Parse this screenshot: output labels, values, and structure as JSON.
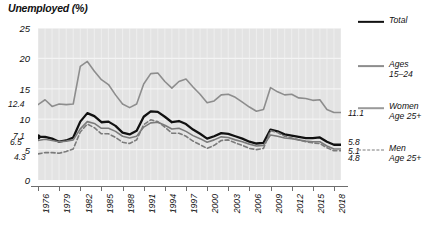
{
  "chart_data": {
    "type": "line",
    "title": "Unemployed (%)",
    "xlabel": "",
    "ylabel": "Unemployed (%)",
    "ylim": [
      0,
      25
    ],
    "yticks": [
      0,
      5,
      10,
      15,
      20,
      25
    ],
    "xlim": [
      1976,
      2019
    ],
    "xticks": [
      1976,
      1979,
      1982,
      1985,
      1988,
      1991,
      1994,
      1997,
      2000,
      2003,
      2006,
      2009,
      2012,
      2015,
      2018
    ],
    "grid": true,
    "legend_position": "right",
    "plot_background": "#e3e3e3",
    "x": [
      1976,
      1977,
      1978,
      1979,
      1980,
      1981,
      1982,
      1983,
      1984,
      1985,
      1986,
      1987,
      1988,
      1989,
      1990,
      1991,
      1992,
      1993,
      1994,
      1995,
      1996,
      1997,
      1998,
      1999,
      2000,
      2001,
      2002,
      2003,
      2004,
      2005,
      2006,
      2007,
      2008,
      2009,
      2010,
      2011,
      2012,
      2013,
      2014,
      2015,
      2016,
      2017,
      2018,
      2019
    ],
    "series": [
      {
        "name": "Total",
        "color": "#111111",
        "style": "solid",
        "width": 2.3,
        "start_label": "7.1",
        "end_label": "5.8",
        "values": [
          7.1,
          7.1,
          6.8,
          6.3,
          6.5,
          7.0,
          9.6,
          11.0,
          10.5,
          9.5,
          9.6,
          8.9,
          7.8,
          7.5,
          8.1,
          10.4,
          11.3,
          11.2,
          10.4,
          9.5,
          9.7,
          9.2,
          8.3,
          7.6,
          6.8,
          7.2,
          7.7,
          7.6,
          7.2,
          6.8,
          6.3,
          6.0,
          6.1,
          8.3,
          8.0,
          7.5,
          7.3,
          7.1,
          6.9,
          6.9,
          7.0,
          6.3,
          5.8,
          5.8
        ]
      },
      {
        "name": "Ages 15–24",
        "color": "#8d8d8d",
        "style": "solid",
        "width": 1.6,
        "start_label": "12.4",
        "end_label": "11.1",
        "values": [
          12.4,
          13.2,
          12.1,
          12.5,
          12.4,
          12.5,
          18.7,
          19.5,
          17.9,
          16.5,
          15.7,
          14.0,
          12.5,
          11.9,
          12.5,
          15.8,
          17.5,
          17.6,
          16.2,
          15.1,
          16.2,
          16.6,
          15.3,
          14.1,
          12.7,
          13.0,
          14.0,
          14.1,
          13.6,
          12.8,
          12.0,
          11.3,
          11.6,
          15.2,
          14.5,
          14.0,
          14.1,
          13.5,
          13.4,
          13.1,
          13.2,
          11.6,
          11.1,
          11.1
        ]
      },
      {
        "name": "Women Age 25+",
        "color": "#7b7b7b",
        "style": "solid",
        "width": 1.6,
        "start_label": "6.5",
        "end_label": "5.1",
        "values": [
          6.5,
          6.7,
          6.5,
          6.3,
          6.4,
          6.6,
          8.4,
          9.6,
          9.3,
          8.5,
          8.5,
          8.0,
          7.2,
          6.9,
          7.2,
          8.7,
          9.4,
          9.5,
          9.0,
          8.4,
          8.5,
          8.0,
          7.3,
          6.8,
          6.2,
          6.6,
          7.1,
          7.0,
          6.6,
          6.3,
          5.9,
          5.6,
          5.7,
          7.4,
          7.2,
          6.9,
          6.8,
          6.6,
          6.4,
          6.3,
          6.3,
          5.6,
          5.1,
          5.1
        ]
      },
      {
        "name": "Men Age 25+",
        "color": "#7b7b7b",
        "style": "dashed",
        "width": 1.6,
        "start_label": "4.3",
        "end_label": "4.8",
        "values": [
          4.3,
          4.5,
          4.5,
          4.4,
          4.7,
          5.1,
          7.9,
          9.2,
          8.6,
          7.6,
          7.6,
          7.0,
          6.2,
          6.0,
          6.6,
          9.1,
          9.9,
          9.6,
          8.7,
          7.7,
          7.7,
          7.2,
          6.4,
          5.8,
          5.2,
          5.7,
          6.5,
          6.6,
          6.1,
          5.7,
          5.2,
          5.0,
          5.2,
          8.1,
          7.8,
          7.2,
          6.9,
          6.6,
          6.3,
          6.1,
          6.0,
          5.3,
          4.8,
          4.8
        ]
      }
    ]
  },
  "axis": {
    "y_labels": [
      "25",
      "20",
      "15",
      "10",
      "5",
      "0"
    ],
    "x_labels": [
      "1976",
      "1979",
      "1982",
      "1985",
      "1988",
      "1991",
      "1994",
      "1997",
      "2000",
      "2003",
      "2006",
      "2009",
      "2012",
      "2015",
      "2018"
    ]
  },
  "legend": {
    "items": [
      {
        "label": "Total",
        "style": "solid",
        "color": "#111111",
        "width": 2.3
      },
      {
        "label": "Ages\n15–24",
        "style": "solid",
        "color": "#8d8d8d",
        "width": 1.8
      },
      {
        "label": "Women\nAge 25+",
        "style": "solid",
        "color": "#9a9a9a",
        "width": 1.6
      },
      {
        "label": "Men\nAge 25+",
        "style": "dashed",
        "color": "#7b7b7b",
        "width": 1.6
      }
    ]
  },
  "start_labels": [
    {
      "text": "12.4",
      "value": 12.4
    },
    {
      "text": "7.1",
      "value": 7.1
    },
    {
      "text": "6.5",
      "value": 6.5
    },
    {
      "text": "4.3",
      "value": 4.3
    }
  ],
  "end_labels": [
    {
      "text": "11.1",
      "value": 11.1
    },
    {
      "text": "5.8",
      "value": 5.8
    },
    {
      "text": "5.1",
      "value": 5.1
    },
    {
      "text": "4.8",
      "value": 4.8
    }
  ]
}
